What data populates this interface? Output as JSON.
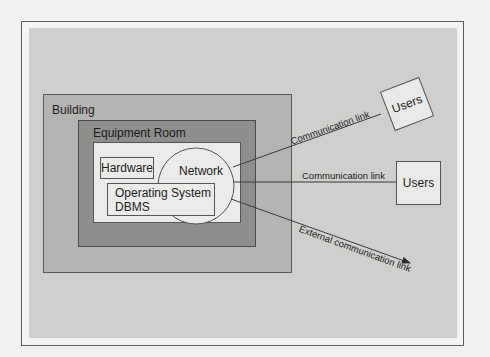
{
  "diagram": {
    "containers": {
      "building": {
        "label": "Building"
      },
      "equipment_room": {
        "label": "Equipment Room"
      }
    },
    "components": {
      "hardware": {
        "label": "Hardware"
      },
      "network": {
        "label": "Network"
      },
      "software": {
        "line1": "Operating System",
        "line2": "DBMS"
      }
    },
    "links": [
      {
        "label": "Communication link",
        "target": "Users"
      },
      {
        "label": "Communication link",
        "target": "Users"
      },
      {
        "label": "External communication link",
        "target": ""
      }
    ],
    "users": [
      {
        "label": "Users"
      },
      {
        "label": "Users"
      }
    ],
    "colors": {
      "page": "#f1f1f0",
      "panel": "#cfcfce",
      "building": "#b4b4b3",
      "equipment_room": "#8e8e8d",
      "inner": "#ebebea",
      "stroke": "#4a4a4a"
    }
  }
}
